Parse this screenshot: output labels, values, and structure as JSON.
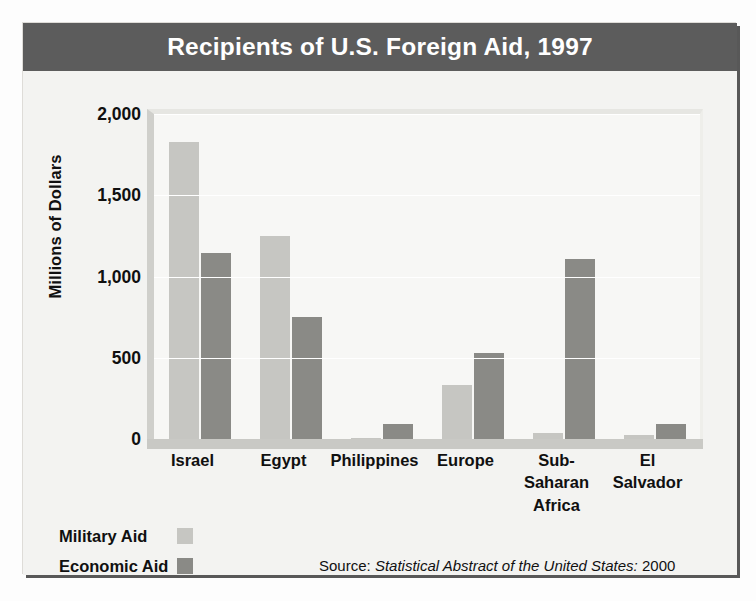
{
  "card": {
    "title": "Recipients of U.S. Foreign Aid, 1997"
  },
  "legend": {
    "items": [
      {
        "label": "Military Aid",
        "swatch": "military-swatch",
        "color": "#c6c6c2"
      },
      {
        "label": "Economic Aid",
        "swatch": "economic-swatch",
        "color": "#8a8a86"
      }
    ]
  },
  "source": {
    "prefix": "Source: ",
    "italic": "Statistical Abstract of the United States:",
    "suffix": " 2000"
  },
  "chart_data": {
    "type": "bar",
    "title": "Recipients of U.S. Foreign Aid, 1997",
    "xlabel": "",
    "ylabel": "Millions of Dollars",
    "ylim": [
      0,
      2000
    ],
    "yticks": [
      0,
      500,
      1000,
      1500,
      2000
    ],
    "ytick_labels": [
      "0",
      "500",
      "1,000",
      "1,500",
      "2,000"
    ],
    "grid": true,
    "legend_position": "bottom-left",
    "categories": [
      "Israel",
      "Egypt",
      "Philippines",
      "Europe",
      "Sub-Saharan Africa",
      "El Salvador"
    ],
    "category_label_lines": [
      [
        "Israel"
      ],
      [
        "Egypt"
      ],
      [
        "Philippines"
      ],
      [
        "Europe"
      ],
      [
        "Sub-Saharan",
        "Africa"
      ],
      [
        "El",
        "Salvador"
      ]
    ],
    "series": [
      {
        "name": "Military Aid",
        "color": "#c6c6c2",
        "values": [
          1830,
          1250,
          5,
          330,
          35,
          25
        ]
      },
      {
        "name": "Economic Aid",
        "color": "#8a8a86",
        "values": [
          1145,
          750,
          95,
          530,
          1110,
          90
        ]
      }
    ]
  }
}
